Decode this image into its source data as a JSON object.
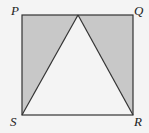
{
  "diagram": {
    "type": "geometry",
    "vertices": {
      "P": {
        "label": "P"
      },
      "Q": {
        "label": "Q"
      },
      "R": {
        "label": "R"
      },
      "S": {
        "label": "S"
      }
    },
    "colors": {
      "shade": "#c8c8c8",
      "stroke": "#333333",
      "background": "#f4f4f4"
    }
  }
}
